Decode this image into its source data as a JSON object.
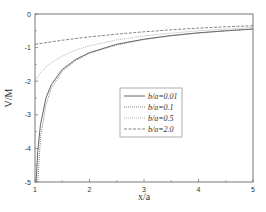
{
  "chart_data": {
    "type": "line",
    "title": "",
    "xlabel": "x/a",
    "ylabel": "V/M",
    "xlim": [
      1,
      5
    ],
    "ylim": [
      -5,
      0
    ],
    "xticks": [
      1,
      2,
      3,
      4,
      5
    ],
    "yticks": [
      0,
      -1,
      -2,
      -3,
      -4,
      -5
    ],
    "grid": false,
    "legend_position": "center-right",
    "series": [
      {
        "name": "b/a=0.01",
        "style": "solid",
        "color": "#555555",
        "x": [
          1.02,
          1.05,
          1.1,
          1.2,
          1.3,
          1.5,
          1.75,
          2.0,
          2.5,
          3.0,
          3.5,
          4.0,
          4.5,
          5.0
        ],
        "y": [
          -5.0,
          -4.1,
          -3.3,
          -2.5,
          -2.1,
          -1.65,
          -1.35,
          -1.15,
          -0.9,
          -0.75,
          -0.64,
          -0.56,
          -0.5,
          -0.45
        ]
      },
      {
        "name": "b/a=0.1",
        "style": "dotted",
        "color": "#777777",
        "x": [
          1.05,
          1.1,
          1.2,
          1.3,
          1.5,
          1.75,
          2.0,
          2.5,
          3.0,
          3.5,
          4.0,
          4.5,
          5.0
        ],
        "y": [
          -5.0,
          -3.7,
          -2.7,
          -2.2,
          -1.7,
          -1.38,
          -1.17,
          -0.92,
          -0.76,
          -0.65,
          -0.57,
          -0.5,
          -0.44
        ]
      },
      {
        "name": "b/a=0.5",
        "style": "dotted-light",
        "color": "#aaaaaa",
        "x": [
          1.0,
          1.1,
          1.2,
          1.3,
          1.5,
          1.75,
          2.0,
          2.5,
          3.0,
          3.5,
          4.0,
          4.5,
          5.0
        ],
        "y": [
          -2.0,
          -1.75,
          -1.58,
          -1.45,
          -1.25,
          -1.07,
          -0.95,
          -0.77,
          -0.65,
          -0.57,
          -0.5,
          -0.45,
          -0.4
        ]
      },
      {
        "name": "b/a=2.0",
        "style": "dashed",
        "color": "#777777",
        "x": [
          1.0,
          1.5,
          2.0,
          2.5,
          3.0,
          3.5,
          4.0,
          4.5,
          5.0
        ],
        "y": [
          -0.9,
          -0.78,
          -0.68,
          -0.6,
          -0.53,
          -0.47,
          -0.42,
          -0.38,
          -0.35
        ]
      }
    ]
  },
  "axes": {
    "xlabel": "x/a",
    "ylabel": "V/M",
    "xtick_labels": [
      "1",
      "2",
      "3",
      "4",
      "5"
    ],
    "ytick_labels": [
      "0",
      "-1",
      "-2",
      "-3",
      "-4",
      "-5"
    ]
  },
  "legend": {
    "items": [
      {
        "label": "b/a=0.01"
      },
      {
        "label": "b/a=0.1"
      },
      {
        "label": "b/a=0.5"
      },
      {
        "label": "b/a=2.0"
      }
    ]
  }
}
